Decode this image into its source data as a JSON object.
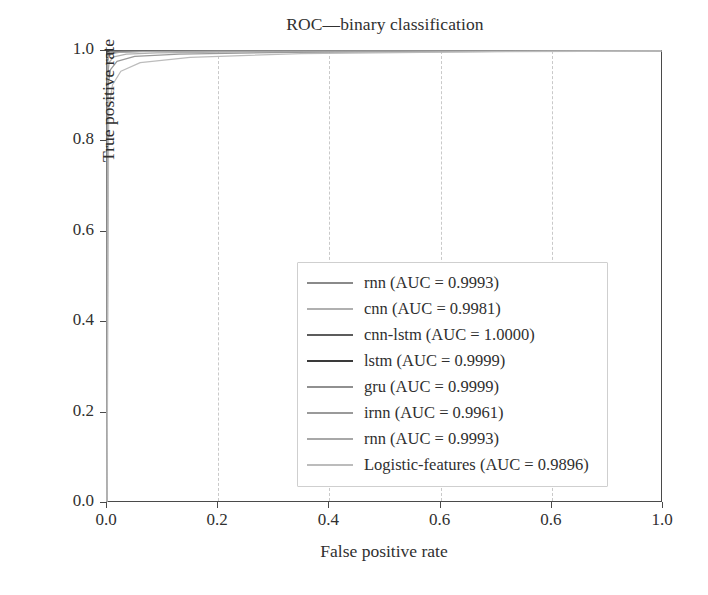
{
  "chart_data": {
    "type": "line",
    "title": "ROC—binary classification",
    "xlabel": "False positive rate",
    "ylabel": "True positive rate",
    "xlim": [
      0.0,
      1.0
    ],
    "ylim": [
      0.0,
      1.0
    ],
    "grid": "vertical-dashed",
    "legend_position": "center",
    "xticks": [
      "0.0",
      "0.2",
      "0.4",
      "0.6",
      "0.6",
      "1.0"
    ],
    "xtick_values": [
      0.0,
      0.2,
      0.4,
      0.6,
      0.8,
      1.0
    ],
    "yticks": [
      "0.0",
      "0.2",
      "0.4",
      "0.6",
      "0.8",
      "1.0"
    ],
    "ytick_values": [
      0.0,
      0.2,
      0.4,
      0.6,
      0.8,
      1.0
    ],
    "series": [
      {
        "name": "rnn",
        "auc": "0.9993",
        "legend_label": "rnn (AUC = 0.9993)",
        "color": "#8a8a8a",
        "x": [
          0.0,
          0.0005,
          0.002,
          0.006,
          0.02,
          0.06,
          0.2,
          0.5,
          1.0
        ],
        "y": [
          0.0,
          0.975,
          0.99,
          0.995,
          0.9975,
          0.999,
          0.9995,
          0.9998,
          1.0
        ]
      },
      {
        "name": "cnn",
        "auc": "0.9981",
        "legend_label": "cnn (AUC = 0.9981)",
        "color": "#b0b0b0",
        "x": [
          0.0,
          0.001,
          0.004,
          0.012,
          0.035,
          0.09,
          0.25,
          0.55,
          1.0
        ],
        "y": [
          0.0,
          0.945,
          0.975,
          0.987,
          0.993,
          0.996,
          0.998,
          0.999,
          1.0
        ]
      },
      {
        "name": "cnn-lstm",
        "auc": "1.0000",
        "legend_label": "cnn-lstm (AUC = 1.0000)",
        "color": "#5c5c5c",
        "x": [
          0.0,
          0.0002,
          0.001,
          0.004,
          0.02,
          0.1,
          0.4,
          1.0
        ],
        "y": [
          0.0,
          0.995,
          0.999,
          0.9997,
          0.9999,
          1.0,
          1.0,
          1.0
        ]
      },
      {
        "name": "lstm",
        "auc": "0.9999",
        "legend_label": "lstm (AUC = 0.9999)",
        "color": "#3a3a3a",
        "x": [
          0.0,
          0.0003,
          0.0012,
          0.005,
          0.025,
          0.12,
          0.45,
          1.0
        ],
        "y": [
          0.0,
          0.99,
          0.997,
          0.9992,
          0.9997,
          0.9999,
          1.0,
          1.0
        ]
      },
      {
        "name": "gru",
        "auc": "0.9999",
        "legend_label": "gru (AUC = 0.9999)",
        "color": "#909090",
        "x": [
          0.0,
          0.0004,
          0.0015,
          0.006,
          0.03,
          0.13,
          0.5,
          1.0
        ],
        "y": [
          0.0,
          0.985,
          0.996,
          0.999,
          0.9996,
          0.9999,
          1.0,
          1.0
        ]
      },
      {
        "name": "irnn",
        "auc": "0.9961",
        "legend_label": "irnn (AUC = 0.9961)",
        "color": "#9a9a9a",
        "x": [
          0.0,
          0.0015,
          0.006,
          0.018,
          0.05,
          0.13,
          0.33,
          0.65,
          1.0
        ],
        "y": [
          0.0,
          0.92,
          0.958,
          0.977,
          0.988,
          0.993,
          0.997,
          0.9988,
          1.0
        ]
      },
      {
        "name": "rnn",
        "auc": "0.9993",
        "legend_label": "rnn (AUC = 0.9993)",
        "color": "#a8a8a8",
        "x": [
          0.0,
          0.0006,
          0.0025,
          0.008,
          0.022,
          0.065,
          0.21,
          0.52,
          1.0
        ],
        "y": [
          0.0,
          0.97,
          0.988,
          0.994,
          0.997,
          0.9987,
          0.9994,
          0.9998,
          1.0
        ]
      },
      {
        "name": "Logistic-features",
        "auc": "0.9896",
        "legend_label": "Logistic-features (AUC = 0.9896)",
        "color": "#bcbcbc",
        "x": [
          0.0,
          0.003,
          0.01,
          0.025,
          0.06,
          0.15,
          0.35,
          0.7,
          1.0
        ],
        "y": [
          0.0,
          0.87,
          0.925,
          0.955,
          0.974,
          0.986,
          0.994,
          0.9985,
          1.0
        ]
      }
    ]
  }
}
